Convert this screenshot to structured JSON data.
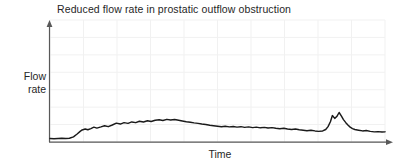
{
  "chart_data": {
    "type": "line",
    "title": "Reduced flow rate in prostatic outflow obstruction",
    "xlabel": "Time",
    "ylabel_lines": [
      "Flow",
      "rate"
    ],
    "ylabel": "Flow rate",
    "grid": true,
    "legend": "none",
    "axis_style": "arrowed",
    "xlim": [
      0,
      100
    ],
    "ylim": [
      0,
      100
    ],
    "xticks": [],
    "yticks": [],
    "series": [
      {
        "name": "Urine flow rate",
        "color": "#1a1a1a",
        "x": [
          0,
          1.2,
          2.4,
          3.5,
          4.7,
          5.8,
          7.0,
          8.1,
          9.0,
          9.6,
          10.5,
          11.3,
          12.2,
          13.1,
          14.0,
          15.2,
          16.3,
          17.4,
          18.6,
          19.8,
          21.0,
          22.1,
          23.3,
          24.4,
          25.6,
          26.7,
          27.9,
          29.1,
          30.2,
          31.4,
          32.6,
          33.7,
          34.9,
          36.0,
          37.2,
          38.4,
          39.5,
          40.7,
          41.9,
          43.0,
          44.2,
          45.3,
          46.5,
          47.7,
          48.8,
          50.0,
          51.2,
          52.3,
          53.5,
          54.7,
          55.8,
          57.0,
          58.1,
          59.3,
          60.5,
          61.6,
          62.8,
          64.0,
          65.1,
          66.3,
          67.4,
          68.6,
          69.8,
          70.9,
          72.1,
          73.3,
          74.4,
          75.6,
          76.7,
          77.9,
          79.1,
          80.2,
          81.4,
          82.3,
          83.0,
          83.7,
          84.3,
          85.0,
          85.6,
          86.3,
          87.0,
          87.6,
          88.3,
          89.0,
          89.6,
          90.3,
          91.0,
          92.1,
          93.3,
          94.4,
          95.6,
          96.8,
          97.9,
          99.1,
          100
        ],
        "y": [
          3.0,
          2.8,
          3.0,
          3.1,
          3.0,
          3.2,
          4.4,
          6.8,
          9.0,
          10.2,
          11.0,
          10.4,
          11.4,
          12.6,
          11.8,
          12.8,
          13.8,
          13.0,
          14.4,
          16.0,
          15.2,
          16.4,
          15.8,
          17.0,
          16.4,
          17.6,
          17.0,
          18.0,
          17.4,
          18.4,
          18.8,
          18.2,
          19.2,
          18.6,
          19.0,
          18.4,
          17.8,
          17.2,
          16.8,
          16.2,
          15.8,
          15.2,
          14.8,
          14.2,
          13.8,
          13.4,
          13.0,
          13.4,
          12.8,
          13.2,
          12.6,
          13.0,
          12.4,
          12.8,
          12.2,
          12.6,
          12.0,
          12.4,
          11.8,
          12.2,
          11.6,
          11.2,
          11.6,
          11.0,
          10.6,
          11.0,
          10.4,
          10.0,
          9.6,
          10.0,
          9.4,
          9.0,
          9.4,
          10.6,
          13.0,
          17.2,
          22.4,
          20.0,
          21.6,
          25.0,
          22.0,
          19.0,
          16.4,
          14.2,
          12.6,
          11.4,
          10.6,
          10.0,
          9.4,
          9.8,
          9.0,
          8.6,
          8.8,
          8.4,
          8.6
        ]
      }
    ],
    "annotations": []
  },
  "colors": {
    "curve": "#1a1a1a",
    "axis": "#595959",
    "grid": "#f1f1f1",
    "text": "#262626",
    "background": "#ffffff"
  }
}
